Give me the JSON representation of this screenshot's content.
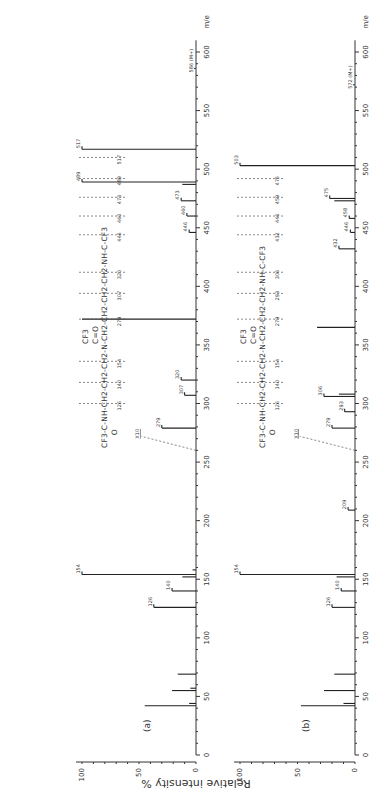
{
  "chart_data": [
    {
      "type": "bar",
      "panel_label": "(a)",
      "title": "",
      "xlabel": "m/e",
      "ylabel": "Relative intensity %",
      "xlim": [
        0,
        620
      ],
      "ylim": [
        0,
        100
      ],
      "x_ticks": [
        0,
        50,
        100,
        150,
        200,
        250,
        300,
        350,
        400,
        450,
        500,
        550,
        600
      ],
      "y_ticks": [
        0,
        50,
        100
      ],
      "scale_marker": {
        "label": "X10",
        "from_mz": 260
      },
      "molecular_ion_label": "586 (M+)",
      "molecular_ion_mz": 586,
      "structure": "CF3-C(=O)-NH-CH2-CH2-CH2-N(C(=O)CF3)-CH2-CH2-CH2-CH2-NH-C(=O)-CF3",
      "fragment_cuts": [
        "126",
        "140",
        "154",
        "279",
        "307",
        "320",
        "446",
        "460",
        "473",
        "489",
        "517",
        "210"
      ],
      "peaks": [
        {
          "mz": 42,
          "intensity": 45,
          "label": ""
        },
        {
          "mz": 44,
          "intensity": 6,
          "label": ""
        },
        {
          "mz": 55,
          "intensity": 21,
          "label": ""
        },
        {
          "mz": 57,
          "intensity": 5,
          "label": ""
        },
        {
          "mz": 69,
          "intensity": 16,
          "label": ""
        },
        {
          "mz": 126,
          "intensity": 37,
          "label": "126"
        },
        {
          "mz": 140,
          "intensity": 21,
          "label": "140"
        },
        {
          "mz": 152,
          "intensity": 12,
          "label": ""
        },
        {
          "mz": 154,
          "intensity": 100,
          "label": "154"
        },
        {
          "mz": 158,
          "intensity": 3,
          "label": ""
        },
        {
          "mz": 279,
          "intensity": 30,
          "label": "279"
        },
        {
          "mz": 307,
          "intensity": 10,
          "label": "307"
        },
        {
          "mz": 320,
          "intensity": 13,
          "label": "320"
        },
        {
          "mz": 372,
          "intensity": 100,
          "label": ""
        },
        {
          "mz": 446,
          "intensity": 6,
          "label": "446"
        },
        {
          "mz": 460,
          "intensity": 8,
          "label": "460"
        },
        {
          "mz": 473,
          "intensity": 13,
          "label": "473"
        },
        {
          "mz": 487,
          "intensity": 12,
          "label": ""
        },
        {
          "mz": 489,
          "intensity": 100,
          "label": "489"
        },
        {
          "mz": 517,
          "intensity": 100,
          "label": "517"
        }
      ]
    },
    {
      "type": "bar",
      "panel_label": "(b)",
      "title": "",
      "xlabel": "m/e",
      "ylabel": "Relative intensity %",
      "xlim": [
        0,
        620
      ],
      "ylim": [
        0,
        100
      ],
      "x_ticks": [
        0,
        50,
        100,
        150,
        200,
        250,
        300,
        350,
        400,
        450,
        500,
        550,
        600
      ],
      "y_ticks": [
        0,
        50,
        100
      ],
      "scale_marker": {
        "label": "X10",
        "from_mz": 260
      },
      "molecular_ion_label": "572 (M+)",
      "molecular_ion_mz": 572,
      "structure": "CF3-C(=O)-NH-CH2-CH2-CH2-N(C(=O)CF3)-CH2-CH2-CH2-NH-C(=O)-CF3",
      "fragment_cuts": [
        "126",
        "140",
        "154",
        "279",
        "293",
        "306",
        "432",
        "446",
        "459",
        "475",
        "503",
        "196"
      ],
      "peaks": [
        {
          "mz": 42,
          "intensity": 47,
          "label": ""
        },
        {
          "mz": 44,
          "intensity": 10,
          "label": ""
        },
        {
          "mz": 55,
          "intensity": 27,
          "label": ""
        },
        {
          "mz": 69,
          "intensity": 18,
          "label": ""
        },
        {
          "mz": 126,
          "intensity": 20,
          "label": "126"
        },
        {
          "mz": 140,
          "intensity": 12,
          "label": "140"
        },
        {
          "mz": 152,
          "intensity": 16,
          "label": ""
        },
        {
          "mz": 154,
          "intensity": 100,
          "label": "154"
        },
        {
          "mz": 209,
          "intensity": 6,
          "label": "209"
        },
        {
          "mz": 279,
          "intensity": 20,
          "label": "279"
        },
        {
          "mz": 293,
          "intensity": 9,
          "label": "293"
        },
        {
          "mz": 306,
          "intensity": 27,
          "label": "306"
        },
        {
          "mz": 308,
          "intensity": 14,
          "label": ""
        },
        {
          "mz": 365,
          "intensity": 33,
          "label": ""
        },
        {
          "mz": 432,
          "intensity": 14,
          "label": "432"
        },
        {
          "mz": 446,
          "intensity": 4,
          "label": "446"
        },
        {
          "mz": 458,
          "intensity": 5,
          "label": "458"
        },
        {
          "mz": 473,
          "intensity": 18,
          "label": ""
        },
        {
          "mz": 475,
          "intensity": 22,
          "label": "475"
        },
        {
          "mz": 503,
          "intensity": 100,
          "label": "503"
        }
      ]
    }
  ],
  "labels": {
    "y_axis_title": "Relative intensity %",
    "x_unit": "m/e",
    "panel_a": "(a)",
    "panel_b": "(b)",
    "x10": "X10",
    "m_ion_a": "586 (M+)",
    "m_ion_b": "572 (M+)"
  }
}
